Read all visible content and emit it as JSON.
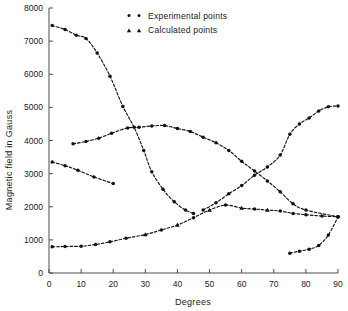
{
  "chart_data": {
    "type": "scatter",
    "title": "",
    "xlabel": "Degrees",
    "ylabel": "Magnetic field  in Gauss",
    "xlim": [
      0,
      90
    ],
    "ylim": [
      0,
      8000
    ],
    "xticks": [
      0,
      10,
      20,
      30,
      40,
      50,
      60,
      70,
      80,
      90
    ],
    "xtick_labels": [
      "0",
      "10",
      "20",
      "30",
      "40",
      "50",
      "60",
      "70",
      "80",
      "90"
    ],
    "yticks": [
      0,
      1000,
      2000,
      3000,
      4000,
      5000,
      6000,
      7000,
      8000
    ],
    "ytick_labels": [
      "0",
      "1000",
      "2000",
      "3000",
      "4000",
      "5000",
      "6000",
      "7000",
      "8000"
    ],
    "grid": false,
    "legend_position": "top-center",
    "legend": [
      {
        "label": "Experimental points",
        "marker": "circle"
      },
      {
        "label": "Calculated points",
        "marker": "triangle"
      }
    ],
    "series": [
      {
        "name": "branch-1-descending",
        "marker": "circle",
        "points": [
          [
            1,
            7470
          ],
          [
            5,
            7350
          ],
          [
            8.5,
            7180
          ],
          [
            11.5,
            7080
          ],
          [
            15,
            6640
          ],
          [
            19,
            5940
          ],
          [
            23,
            5030
          ],
          [
            26.5,
            4400
          ],
          [
            29.5,
            3700
          ],
          [
            32,
            3060
          ],
          [
            35.5,
            2530
          ],
          [
            39,
            2150
          ],
          [
            42.5,
            1900
          ],
          [
            45,
            1800
          ]
        ]
      },
      {
        "name": "branch-2-hump",
        "marker": "circle",
        "points": [
          [
            7.5,
            3900
          ],
          [
            11.5,
            3970
          ],
          [
            15.5,
            4070
          ],
          [
            19.5,
            4220
          ],
          [
            24.5,
            4380
          ],
          [
            28,
            4400
          ],
          [
            32,
            4440
          ],
          [
            36,
            4450
          ],
          [
            40,
            4360
          ],
          [
            44,
            4270
          ],
          [
            48,
            4100
          ],
          [
            52,
            3930
          ],
          [
            56,
            3700
          ],
          [
            60,
            3370
          ],
          [
            64,
            3080
          ],
          [
            68,
            2780
          ],
          [
            72,
            2450
          ],
          [
            76,
            2090
          ],
          [
            80,
            1900
          ],
          [
            90,
            1700
          ]
        ]
      },
      {
        "name": "branch-3-short-descending",
        "marker": "circle",
        "points": [
          [
            1,
            3350
          ],
          [
            5,
            3240
          ],
          [
            9,
            3100
          ],
          [
            14,
            2900
          ],
          [
            20,
            2700
          ]
        ]
      },
      {
        "name": "branch-4-ascending-calculated",
        "marker": "mixed",
        "points": [
          [
            1,
            790
          ],
          [
            5,
            800
          ],
          [
            10,
            810
          ],
          [
            14.5,
            860
          ],
          [
            19,
            940
          ],
          [
            24,
            1050
          ],
          [
            30,
            1160
          ],
          [
            35,
            1300
          ],
          [
            40,
            1450
          ],
          [
            45,
            1670
          ],
          [
            50,
            1900
          ],
          [
            55,
            2050
          ],
          [
            60,
            1960
          ],
          [
            64,
            1930
          ],
          [
            68,
            1900
          ],
          [
            72,
            1870
          ],
          [
            76,
            1800
          ],
          [
            80,
            1760
          ],
          [
            85,
            1720
          ],
          [
            90,
            1700
          ]
        ],
        "calculated_x": [
          30,
          40,
          50,
          60,
          68
        ]
      },
      {
        "name": "branch-5-rising-right",
        "marker": "circle",
        "points": [
          [
            48,
            1900
          ],
          [
            52,
            2120
          ],
          [
            56,
            2390
          ],
          [
            60,
            2640
          ],
          [
            64,
            2950
          ],
          [
            68,
            3200
          ],
          [
            72,
            3560
          ],
          [
            75,
            4190
          ],
          [
            78,
            4500
          ],
          [
            81,
            4680
          ],
          [
            84,
            4890
          ],
          [
            87,
            5020
          ],
          [
            90,
            5040
          ]
        ]
      },
      {
        "name": "branch-6-bottom-right",
        "marker": "circle",
        "points": [
          [
            75,
            600
          ],
          [
            78,
            660
          ],
          [
            81,
            720
          ],
          [
            84,
            830
          ],
          [
            87,
            1150
          ],
          [
            90,
            1690
          ]
        ]
      }
    ]
  }
}
